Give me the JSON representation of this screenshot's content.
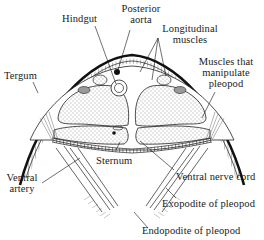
{
  "diagram": {
    "labels": {
      "hindgut": "Hindgut",
      "posterior_aorta_1": "Posterior",
      "posterior_aorta_2": "aorta",
      "longitudinal_muscles_1": "Longitudinal",
      "longitudinal_muscles_2": "muscles",
      "muscles_pleopod_1": "Muscles that",
      "muscles_pleopod_2": "manipulate",
      "muscles_pleopod_3": "pleopod",
      "tergum": "Tergum",
      "sternum": "Sternum",
      "ventral_artery_1": "Ventral",
      "ventral_artery_2": "artery",
      "ventral_nerve_cord": "Ventral nerve cord",
      "exopodite": "Exopodite of pleopod",
      "endopodite": "Endopodite of pleopod"
    },
    "colors": {
      "ink": "#1a1a1a",
      "background": "#ffffff"
    }
  }
}
